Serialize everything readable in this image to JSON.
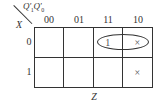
{
  "kmap": {
    "column_variable": "Q'₁Q'₀",
    "column_variable_parts": {
      "q1": "Q'",
      "q1_sub": "1",
      "q0": "Q'",
      "q0_sub": "0"
    },
    "row_variable": "X",
    "column_headers": [
      "00",
      "01",
      "11",
      "10"
    ],
    "row_headers": [
      "0",
      "1"
    ],
    "cells": [
      [
        "",
        "",
        "1",
        "×"
      ],
      [
        "",
        "",
        "",
        "×"
      ]
    ],
    "groups": [
      {
        "row": 0,
        "columns": [
          "11",
          "10"
        ],
        "shape": "oval"
      }
    ],
    "output_label": "Z"
  }
}
